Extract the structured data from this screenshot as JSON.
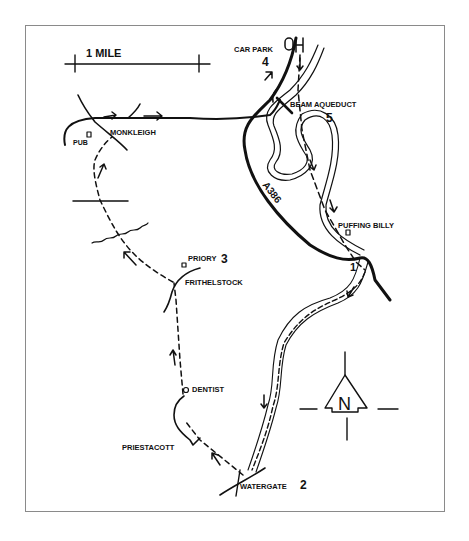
{
  "map": {
    "scale_label": "1 MILE",
    "north_label": "N",
    "road_label": "A386",
    "colors": {
      "ink": "#111111",
      "frame": "#8a8a8a",
      "background": "#ffffff"
    },
    "places": [
      {
        "id": "car-park",
        "name": "CAR PARK",
        "stop": "4"
      },
      {
        "id": "beam-aqueduct",
        "name": "BEAM AQUEDUCT",
        "stop": "5"
      },
      {
        "id": "puffing-billy",
        "name": "PUFFING BILLY",
        "stop": "1"
      },
      {
        "id": "watergate",
        "name": "WATERGATE",
        "stop": "2"
      },
      {
        "id": "priory",
        "name": "PRIORY",
        "stop": "3"
      },
      {
        "id": "frithelstock",
        "name": "FRITHELSTOCK"
      },
      {
        "id": "dentist",
        "name": "DENTIST"
      },
      {
        "id": "priestacott",
        "name": "PRIESTACOTT"
      },
      {
        "id": "monkleigh",
        "name": "MONKLEIGH"
      },
      {
        "id": "pub",
        "name": "PUB"
      }
    ],
    "parking_symbol": "P"
  }
}
